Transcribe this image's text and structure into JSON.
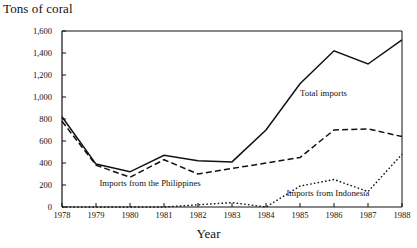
{
  "chart_data": {
    "type": "line",
    "title": "",
    "ylabel": "Tons of coral",
    "xlabel": "Year",
    "ylim": [
      0,
      1600
    ],
    "ytick_labels": [
      "0",
      "200",
      "400",
      "600",
      "800",
      "1,000",
      "1,200",
      "1,400",
      "1,600"
    ],
    "ytick_values": [
      0,
      200,
      400,
      600,
      800,
      1000,
      1200,
      1400,
      1600
    ],
    "grid": false,
    "legend_position": "inline-annotations",
    "x": [
      1978,
      1979,
      1980,
      1981,
      1982,
      1983,
      1984,
      1985,
      1986,
      1987,
      1988
    ],
    "xtick_labels": [
      "1978",
      "1979",
      "1980",
      "1981",
      "1982",
      "1983",
      "1984",
      "1985",
      "1986",
      "1987",
      "1988"
    ],
    "series": [
      {
        "name": "Total imports",
        "style": "solid",
        "color": "#111111",
        "values": [
          820,
          390,
          320,
          470,
          420,
          410,
          700,
          1120,
          1420,
          1300,
          1520
        ]
      },
      {
        "name": "Imports from the Philippines",
        "style": "dashed",
        "color": "#111111",
        "values": [
          780,
          380,
          270,
          430,
          300,
          350,
          400,
          450,
          700,
          710,
          640
        ]
      },
      {
        "name": "Imports from Indonesia",
        "style": "dotted",
        "color": "#111111",
        "values": [
          0,
          0,
          0,
          0,
          20,
          40,
          0,
          190,
          250,
          140,
          480
        ]
      }
    ],
    "annotations": [
      {
        "text": "Total imports",
        "x": 1985,
        "y": 1030
      },
      {
        "text": "Imports from the Philippines",
        "x": 1979.1,
        "y": 205
      },
      {
        "text": "Imports from Indonesia",
        "x": 1984.6,
        "y": 115
      }
    ]
  }
}
